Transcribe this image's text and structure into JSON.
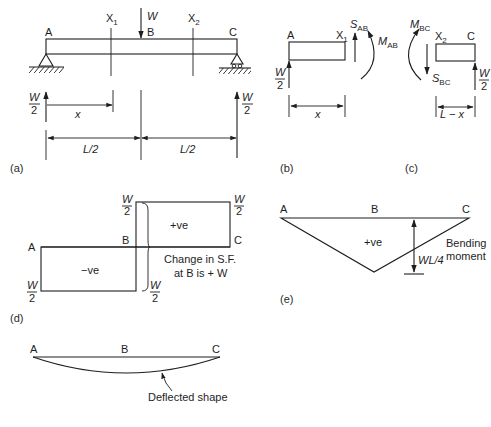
{
  "figure": {
    "panel_a": {
      "caption": "(a)",
      "points": {
        "A": "A",
        "B": "B",
        "C": "C"
      },
      "sections": {
        "x1": "X",
        "x1_sub": "1",
        "x2": "X",
        "x2_sub": "2"
      },
      "load": "W",
      "reaction_left": {
        "num": "W",
        "den": "2"
      },
      "reaction_right": {
        "num": "W",
        "den": "2"
      },
      "dim_x": "x",
      "dim_left_half": "L/2",
      "dim_right_half": "L/2"
    },
    "panel_b": {
      "caption": "(b)",
      "left_label": "A",
      "right_label": "X",
      "right_label_sub": "1",
      "shear": "S",
      "shear_sub": "AB",
      "moment": "M",
      "moment_sub": "AB",
      "reaction": {
        "num": "W",
        "den": "2"
      },
      "dim": "x"
    },
    "panel_c": {
      "caption": "(c)",
      "left_label": "X",
      "left_label_sub": "2",
      "right_label": "C",
      "shear": "S",
      "shear_sub": "BC",
      "moment": "M",
      "moment_sub": "BC",
      "reaction": {
        "num": "W",
        "den": "2"
      },
      "dim": "L − x"
    },
    "panel_d": {
      "caption": "(d)",
      "title": "Shear force diagram",
      "points": {
        "A": "A",
        "B": "B",
        "C": "C"
      },
      "positive_label": "+ve",
      "negative_label": "−ve",
      "top_left_value": {
        "num": "W",
        "den": "2"
      },
      "top_right_value": {
        "num": "W",
        "den": "2"
      },
      "bottom_left_value": {
        "num": "W",
        "den": "2"
      },
      "bottom_mid_value": {
        "num": "W",
        "den": "2"
      },
      "note_line1": "Change in S.F.",
      "note_line2": "at B is + W"
    },
    "panel_e": {
      "caption": "(e)",
      "points": {
        "A": "A",
        "B": "B",
        "C": "C"
      },
      "sign_label": "+ve",
      "max_value": "WL/4",
      "label_line1": "Bending",
      "label_line2": "moment"
    },
    "panel_f": {
      "points": {
        "A": "A",
        "B": "B",
        "C": "C"
      },
      "label": "Deflected shape"
    }
  },
  "colors": {
    "ink": "#1e1e1e",
    "background": "#ffffff"
  }
}
